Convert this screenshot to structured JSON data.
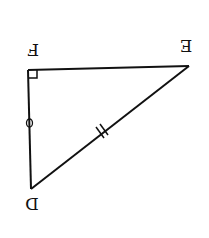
{
  "diagram": {
    "type": "right-triangle",
    "orientation": "rotated 180 degrees",
    "stroke_color": "#111111",
    "background": "#ffffff",
    "vertices": [
      {
        "label": "F",
        "x": 28,
        "y": 70,
        "label_x": 33,
        "label_y": 50
      },
      {
        "label": "E",
        "x": 189,
        "y": 66,
        "label_x": 186,
        "label_y": 46
      },
      {
        "label": "D",
        "x": 31,
        "y": 189,
        "label_x": 32,
        "label_y": 202
      }
    ],
    "right_angle_at": "F",
    "markings": {
      "FD": "single circle mark",
      "DE": "double tick mark"
    }
  }
}
